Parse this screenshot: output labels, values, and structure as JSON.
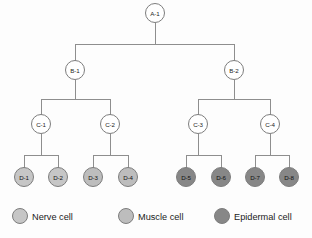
{
  "diagram": {
    "type": "lineage-tree",
    "background_color": "#fdfdfd",
    "edge_color": "#8e8e8e",
    "node_stroke_color": "#7d7d7d",
    "levels": [
      "A",
      "B",
      "C",
      "D"
    ],
    "nodes": [
      {
        "id": "A-1",
        "label": "A-1",
        "level": "A",
        "x": 155,
        "y": 13,
        "r": 9.5,
        "fill": "#ffffff",
        "cell_type": "undifferentiated",
        "parent": null
      },
      {
        "id": "B-1",
        "label": "B-1",
        "level": "B",
        "x": 75,
        "y": 70,
        "r": 9.5,
        "fill": "#ffffff",
        "cell_type": "undifferentiated",
        "parent": "A-1"
      },
      {
        "id": "B-2",
        "label": "B-2",
        "level": "B",
        "x": 234,
        "y": 70,
        "r": 9.5,
        "fill": "#ffffff",
        "cell_type": "undifferentiated",
        "parent": "A-1"
      },
      {
        "id": "C-1",
        "label": "C-1",
        "level": "C",
        "x": 41,
        "y": 124,
        "r": 9.5,
        "fill": "#ffffff",
        "cell_type": "undifferentiated",
        "parent": "B-1"
      },
      {
        "id": "C-2",
        "label": "C-2",
        "level": "C",
        "x": 110,
        "y": 124,
        "r": 9.5,
        "fill": "#ffffff",
        "cell_type": "undifferentiated",
        "parent": "B-1"
      },
      {
        "id": "C-3",
        "label": "C-3",
        "level": "C",
        "x": 198,
        "y": 124,
        "r": 9.5,
        "fill": "#ffffff",
        "cell_type": "undifferentiated",
        "parent": "B-2"
      },
      {
        "id": "C-4",
        "label": "C-4",
        "level": "C",
        "x": 270,
        "y": 124,
        "r": 9.5,
        "fill": "#ffffff",
        "cell_type": "undifferentiated",
        "parent": "B-2"
      },
      {
        "id": "D-1",
        "label": "D-1",
        "level": "D",
        "x": 24,
        "y": 177,
        "r": 9.5,
        "fill": "#c6c6c6",
        "cell_type": "nerve",
        "parent": "C-1"
      },
      {
        "id": "D-2",
        "label": "D-2",
        "level": "D",
        "x": 58,
        "y": 177,
        "r": 9.5,
        "fill": "#c6c6c6",
        "cell_type": "nerve",
        "parent": "C-1"
      },
      {
        "id": "D-3",
        "label": "D-3",
        "level": "D",
        "x": 93,
        "y": 177,
        "r": 9.5,
        "fill": "#bdbdbd",
        "cell_type": "muscle",
        "parent": "C-2"
      },
      {
        "id": "D-4",
        "label": "D-4",
        "level": "D",
        "x": 128,
        "y": 177,
        "r": 9.5,
        "fill": "#bdbdbd",
        "cell_type": "muscle",
        "parent": "C-2"
      },
      {
        "id": "D-5",
        "label": "D-5",
        "level": "D",
        "x": 186,
        "y": 177,
        "r": 9.5,
        "fill": "#878787",
        "cell_type": "epidermal",
        "parent": "C-3"
      },
      {
        "id": "D-6",
        "label": "D-6",
        "level": "D",
        "x": 221,
        "y": 177,
        "r": 9.5,
        "fill": "#878787",
        "cell_type": "epidermal",
        "parent": "C-3"
      },
      {
        "id": "D-7",
        "label": "D-7",
        "level": "D",
        "x": 255,
        "y": 177,
        "r": 9.5,
        "fill": "#878787",
        "cell_type": "epidermal",
        "parent": "C-4"
      },
      {
        "id": "D-8",
        "label": "D-8",
        "level": "D",
        "x": 289,
        "y": 177,
        "r": 9.5,
        "fill": "#878787",
        "cell_type": "epidermal",
        "parent": "C-4"
      }
    ],
    "connectors": [
      {
        "name": "a1-to-b-bus",
        "parent": "A-1",
        "children": [
          "B-1",
          "B-2"
        ],
        "bus_y": 44
      },
      {
        "name": "b1-to-c-bus",
        "parent": "B-1",
        "children": [
          "C-1",
          "C-2"
        ],
        "bus_y": 99
      },
      {
        "name": "b2-to-c-bus",
        "parent": "B-2",
        "children": [
          "C-3",
          "C-4"
        ],
        "bus_y": 99
      },
      {
        "name": "c1-to-d-bus",
        "parent": "C-1",
        "children": [
          "D-1",
          "D-2"
        ],
        "bus_y": 155
      },
      {
        "name": "c2-to-d-bus",
        "parent": "C-2",
        "children": [
          "D-3",
          "D-4"
        ],
        "bus_y": 155
      },
      {
        "name": "c3-to-d-bus",
        "parent": "C-3",
        "children": [
          "D-5",
          "D-6"
        ],
        "bus_y": 155
      },
      {
        "name": "c4-to-d-bus",
        "parent": "C-4",
        "children": [
          "D-7",
          "D-8"
        ],
        "bus_y": 155
      }
    ]
  },
  "legend": {
    "name": "cell-type-legend",
    "swatch_radius": 7.5,
    "y": 216,
    "items": [
      {
        "key": "nerve",
        "label": "Nerve cell",
        "color": "#c6c6c6",
        "swatch_x": 20,
        "text_x": 32
      },
      {
        "key": "muscle",
        "label": "Muscle cell",
        "color": "#bdbdbd",
        "swatch_x": 126,
        "text_x": 138
      },
      {
        "key": "epidermal",
        "label": "Epidermal cell",
        "color": "#878787",
        "swatch_x": 222,
        "text_x": 234
      }
    ]
  }
}
